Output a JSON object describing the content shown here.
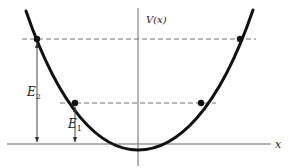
{
  "diagram": {
    "type": "potential-well",
    "labels": {
      "y_axis": "V(x)",
      "x_axis": "x",
      "energy_high": "E",
      "energy_high_sub": "2",
      "energy_low": "E",
      "energy_low_sub": "1"
    },
    "colors": {
      "curve": "#111111",
      "axes": "#555555",
      "dashed": "#777777",
      "points": "#111111"
    },
    "energy_levels": [
      {
        "name": "E1",
        "y": 103,
        "x_left": 75,
        "x_right": 201
      },
      {
        "name": "E2",
        "y": 39,
        "x_left": 37,
        "x_right": 240
      }
    ]
  }
}
